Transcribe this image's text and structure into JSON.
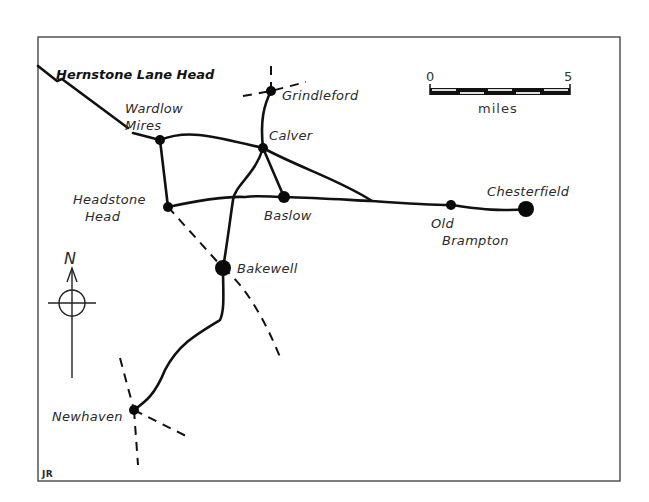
{
  "map": {
    "title": "Hernstone Lane Head",
    "frame": {
      "x": 38,
      "y": 37,
      "width": 582,
      "height": 444
    },
    "scale_bar": {
      "start_label": "0",
      "end_label": "5",
      "unit_label": "miles",
      "x": 430,
      "y": 88,
      "width": 140,
      "segments": 5
    },
    "compass": {
      "label": "N",
      "cx": 72,
      "cy": 303
    },
    "signature": "JR",
    "towns": [
      {
        "id": "grindleford",
        "name": "Grindleford",
        "x": 271,
        "y": 91,
        "r": 5,
        "lx": 282,
        "ly": 100
      },
      {
        "id": "wardlow-mires",
        "name": "Wardlow\nMires",
        "x": 160,
        "y": 140,
        "r": 5,
        "lx": 125,
        "ly": 113
      },
      {
        "id": "calver",
        "name": "Calver",
        "x": 263,
        "y": 148,
        "r": 5,
        "lx": 269,
        "ly": 140
      },
      {
        "id": "baslow",
        "name": "Baslow",
        "x": 284,
        "y": 197,
        "r": 6,
        "lx": 264,
        "ly": 220
      },
      {
        "id": "headstone-head",
        "name": "Headstone\nHead",
        "x": 168,
        "y": 207,
        "r": 5,
        "lx": 73,
        "ly": 204
      },
      {
        "id": "old-brampton",
        "name": "Old\nBrampton",
        "x": 451,
        "y": 205,
        "r": 5,
        "lx": 431,
        "ly": 228
      },
      {
        "id": "chesterfield",
        "name": "Chesterfield",
        "x": 526,
        "y": 209,
        "r": 8,
        "lx": 487,
        "ly": 196
      },
      {
        "id": "bakewell",
        "name": "Bakewell",
        "x": 223,
        "y": 268,
        "r": 8,
        "lx": 237,
        "ly": 273
      },
      {
        "id": "newhaven",
        "name": "Newhaven",
        "x": 134,
        "y": 410,
        "r": 5,
        "lx": 52,
        "ly": 421
      }
    ],
    "roads": [
      "M38,66 L57,81 L62,79 L128,128 M133,133 L160,140 C185,130 205,134 263,148",
      "M160,140 L168,207",
      "M168,207 C200,200 225,196 245,197 C260,195 270,197 284,197 C320,198 350,200 372,201 C400,203 430,205 451,205 C475,208 495,212 526,209",
      "M271,91 C264,105 260,120 263,148",
      "M263,148 L284,197",
      "M263,148 C300,168 340,180 372,201",
      "M263,148 C255,175 235,185 233,200 C230,220 227,245 223,268",
      "M223,268 C223,290 225,310 220,320 C195,335 178,345 165,370 C155,395 145,402 134,410"
    ],
    "tracks": [
      "M243,96 L271,91 L306,82",
      "M271,91 L271,66",
      "M168,207 L223,268",
      "M223,268 C245,285 265,320 280,357",
      "M120,358 L134,410",
      "M134,410 L190,438",
      "M134,410 L138,465"
    ]
  }
}
